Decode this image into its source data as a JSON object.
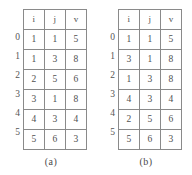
{
  "figure": {
    "panels": [
      {
        "id": "panel-a",
        "caption": "(a)",
        "table": {
          "columns": [
            "i",
            "j",
            "v"
          ],
          "row_labels": [
            "0",
            "1",
            "2",
            "3",
            "4",
            "5"
          ],
          "rows": [
            [
              "1",
              "1",
              "5"
            ],
            [
              "1",
              "3",
              "8"
            ],
            [
              "2",
              "5",
              "6"
            ],
            [
              "3",
              "1",
              "8"
            ],
            [
              "4",
              "3",
              "4"
            ],
            [
              "5",
              "6",
              "3"
            ]
          ]
        }
      },
      {
        "id": "panel-b",
        "caption": "(b)",
        "table": {
          "columns": [
            "i",
            "j",
            "v"
          ],
          "row_labels": [
            "0",
            "1",
            "2",
            "3",
            "4",
            "5"
          ],
          "rows": [
            [
              "1",
              "1",
              "5"
            ],
            [
              "3",
              "1",
              "8"
            ],
            [
              "1",
              "3",
              "8"
            ],
            [
              "4",
              "3",
              "4"
            ],
            [
              "2",
              "5",
              "6"
            ],
            [
              "5",
              "6",
              "3"
            ]
          ]
        }
      }
    ],
    "colors": {
      "background": "#ffffff",
      "border": "#8a8a8a",
      "text": "#4f4f4f"
    }
  }
}
